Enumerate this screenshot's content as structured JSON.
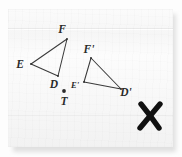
{
  "figure": {
    "ink_color": "#2a2a2a",
    "paper_color": "#f8f8f8",
    "mark_color": "#111111",
    "triangles": [
      {
        "name": "triangle-def",
        "vertices": [
          {
            "label": "E",
            "x": 31,
            "y": 64,
            "label_x": 20,
            "label_y": 68
          },
          {
            "label": "F",
            "x": 67,
            "y": 39,
            "label_x": 62,
            "label_y": 33
          },
          {
            "label": "D",
            "x": 58,
            "y": 76,
            "label_x": 54,
            "label_y": 88
          }
        ]
      },
      {
        "name": "triangle-def-prime",
        "vertices": [
          {
            "label": "E'",
            "x": 84,
            "y": 82,
            "label_x": 74,
            "label_y": 87
          },
          {
            "label": "F'",
            "x": 91,
            "y": 58,
            "label_x": 87,
            "label_y": 53
          },
          {
            "label": "D'",
            "x": 121,
            "y": 89,
            "label_x": 119,
            "label_y": 96
          }
        ]
      }
    ],
    "points": [
      {
        "label": "T",
        "name": "center-of-rotation-t",
        "x": 64,
        "y": 91,
        "label_x": 64,
        "label_y": 104
      }
    ],
    "marks": [
      {
        "label": "X",
        "name": "x-mark",
        "x": 150,
        "y": 116
      }
    ]
  }
}
